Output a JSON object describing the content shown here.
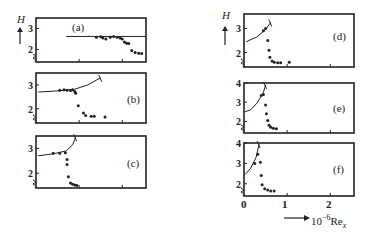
{
  "chart_data": [
    {
      "panel": "(a)",
      "type": "scatter",
      "ylabel": "H",
      "yticks": [
        "2",
        "3"
      ],
      "xrange": [
        0,
        2.55
      ],
      "yrange": [
        1.4,
        3.5
      ],
      "reference_line": {
        "y": 2.62,
        "x_start": 0.7,
        "x_end": 2.55
      },
      "points": [
        [
          1.4,
          2.58
        ],
        [
          1.5,
          2.6
        ],
        [
          1.55,
          2.55
        ],
        [
          1.62,
          2.5
        ],
        [
          1.72,
          2.58
        ],
        [
          1.8,
          2.62
        ],
        [
          1.88,
          2.58
        ],
        [
          1.95,
          2.55
        ],
        [
          2.0,
          2.5
        ],
        [
          2.05,
          2.35
        ],
        [
          2.1,
          2.3
        ],
        [
          2.15,
          2.28
        ],
        [
          2.22,
          1.95
        ],
        [
          2.3,
          1.85
        ],
        [
          2.38,
          1.82
        ],
        [
          2.45,
          1.8
        ]
      ]
    },
    {
      "panel": "(b)",
      "type": "scatter",
      "ylabel": "",
      "yticks": [
        "2",
        "3"
      ],
      "xrange": [
        0,
        2.55
      ],
      "yrange": [
        1.4,
        3.5
      ],
      "laminar_curve": [
        [
          0.05,
          2.7
        ],
        [
          0.5,
          2.75
        ],
        [
          0.9,
          2.82
        ],
        [
          1.2,
          3.0
        ],
        [
          1.4,
          3.2
        ],
        [
          1.5,
          3.3
        ]
      ],
      "points": [
        [
          0.55,
          2.78
        ],
        [
          0.65,
          2.8
        ],
        [
          0.72,
          2.78
        ],
        [
          0.8,
          2.76
        ],
        [
          0.85,
          2.8
        ],
        [
          0.9,
          2.72
        ],
        [
          0.92,
          2.65
        ],
        [
          0.98,
          2.12
        ],
        [
          1.1,
          1.82
        ],
        [
          1.15,
          1.72
        ],
        [
          1.28,
          1.68
        ],
        [
          1.35,
          1.68
        ],
        [
          1.6,
          1.65
        ]
      ]
    },
    {
      "panel": "(c)",
      "type": "scatter",
      "ylabel": "",
      "yticks": [
        "2",
        "3"
      ],
      "xrange": [
        0,
        2.55
      ],
      "yrange": [
        1.4,
        3.5
      ],
      "laminar_curve": [
        [
          0.05,
          2.7
        ],
        [
          0.4,
          2.78
        ],
        [
          0.7,
          2.9
        ],
        [
          0.85,
          3.15
        ],
        [
          0.92,
          3.45
        ]
      ],
      "points": [
        [
          0.4,
          2.8
        ],
        [
          0.55,
          2.8
        ],
        [
          0.68,
          2.82
        ],
        [
          0.72,
          2.55
        ],
        [
          0.72,
          2.35
        ],
        [
          0.75,
          1.85
        ],
        [
          0.8,
          1.6
        ],
        [
          0.85,
          1.55
        ],
        [
          0.9,
          1.52
        ],
        [
          0.95,
          1.5
        ]
      ]
    },
    {
      "panel": "(d)",
      "type": "scatter",
      "ylabel": "H",
      "yticks": [
        "2",
        "3"
      ],
      "xrange": [
        0,
        2.55
      ],
      "yrange": [
        1.4,
        3.6
      ],
      "laminar_curve": [
        [
          0.05,
          2.45
        ],
        [
          0.3,
          2.65
        ],
        [
          0.5,
          2.95
        ],
        [
          0.62,
          3.25
        ]
      ],
      "points": [
        [
          0.45,
          2.9
        ],
        [
          0.5,
          3.0
        ],
        [
          0.55,
          2.5
        ],
        [
          0.58,
          2.1
        ],
        [
          0.6,
          1.8
        ],
        [
          0.65,
          1.65
        ],
        [
          0.7,
          1.6
        ],
        [
          0.78,
          1.58
        ],
        [
          0.85,
          1.58
        ],
        [
          1.05,
          1.6
        ]
      ]
    },
    {
      "panel": "(e)",
      "type": "scatter",
      "ylabel": "",
      "yticks": [
        "2",
        "3",
        "4"
      ],
      "xrange": [
        0,
        2.55
      ],
      "yrange": [
        1.4,
        4.0
      ],
      "laminar_curve": [
        [
          0.02,
          2.5
        ],
        [
          0.15,
          2.6
        ],
        [
          0.3,
          2.95
        ],
        [
          0.45,
          3.5
        ],
        [
          0.5,
          3.9
        ]
      ],
      "points": [
        [
          0.4,
          3.35
        ],
        [
          0.45,
          3.4
        ],
        [
          0.5,
          2.85
        ],
        [
          0.52,
          2.4
        ],
        [
          0.55,
          2.05
        ],
        [
          0.58,
          1.8
        ],
        [
          0.62,
          1.7
        ],
        [
          0.68,
          1.65
        ],
        [
          0.75,
          1.62
        ]
      ]
    },
    {
      "panel": "(f)",
      "type": "scatter",
      "ylabel": "",
      "yticks": [
        "2",
        "3",
        "4"
      ],
      "xrange": [
        0,
        2.55
      ],
      "yrange": [
        1.4,
        4.0
      ],
      "xticks": [
        "0",
        "1",
        "2"
      ],
      "xlabel": "10^-6 Re_x",
      "laminar_curve": [
        [
          0.02,
          2.45
        ],
        [
          0.15,
          2.75
        ],
        [
          0.28,
          3.3
        ],
        [
          0.35,
          3.95
        ]
      ],
      "points": [
        [
          0.25,
          3.0
        ],
        [
          0.32,
          3.45
        ],
        [
          0.38,
          3.05
        ],
        [
          0.4,
          2.4
        ],
        [
          0.42,
          1.95
        ],
        [
          0.48,
          1.75
        ],
        [
          0.55,
          1.7
        ],
        [
          0.62,
          1.65
        ],
        [
          0.7,
          1.65
        ]
      ]
    }
  ],
  "labels": {
    "panels": [
      "(a)",
      "(b)",
      "(c)",
      "(d)",
      "(e)",
      "(f)"
    ],
    "y_axis_symbol": "H",
    "x_axis_label_prefix": "10",
    "x_axis_label_exp": "−6",
    "x_axis_label_var": "Re",
    "x_axis_label_sub": "x",
    "x_ticks": [
      "0",
      "1",
      "2"
    ],
    "y_ticks_low": [
      "2",
      "3"
    ],
    "y_ticks_high": [
      "2",
      "3",
      "4"
    ]
  }
}
